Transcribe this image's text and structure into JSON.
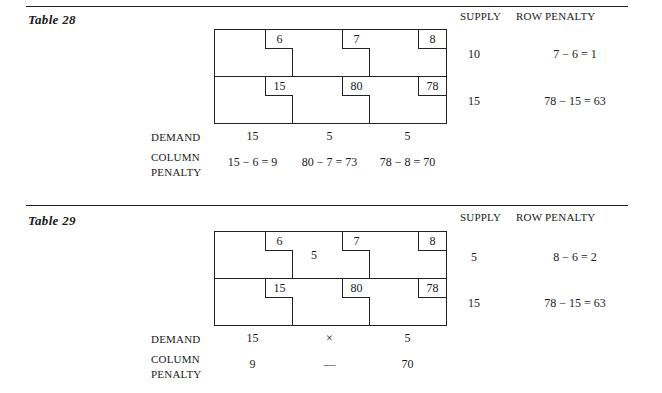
{
  "tables": [
    {
      "title": "Table 28",
      "headers": {
        "supply": "SUPPLY",
        "row_penalty": "ROW PENALTY"
      },
      "costs": [
        [
          "6",
          "7",
          "8"
        ],
        [
          "15",
          "80",
          "78"
        ]
      ],
      "allocations": [
        [
          "",
          "",
          ""
        ],
        [
          "",
          "",
          ""
        ]
      ],
      "supply": [
        "10",
        "15"
      ],
      "row_penalty": [
        "7 − 6 = 1",
        "78 − 15 = 63"
      ],
      "demand_label": "DEMAND",
      "demand": [
        "15",
        "5",
        "5"
      ],
      "column_penalty_label": [
        "COLUMN",
        "PENALTY"
      ],
      "column_penalty": [
        "15 − 6 = 9",
        "80 − 7 = 73",
        "78 − 8 = 70"
      ]
    },
    {
      "title": "Table 29",
      "headers": {
        "supply": "SUPPLY",
        "row_penalty": "ROW PENALTY"
      },
      "costs": [
        [
          "6",
          "7",
          "8"
        ],
        [
          "15",
          "80",
          "78"
        ]
      ],
      "allocations": [
        [
          "",
          "5",
          ""
        ],
        [
          "",
          "",
          ""
        ]
      ],
      "supply": [
        "5",
        "15"
      ],
      "row_penalty": [
        "8 − 6 = 2",
        "78 − 15 = 63"
      ],
      "demand_label": "DEMAND",
      "demand": [
        "15",
        "×",
        "5"
      ],
      "column_penalty_label": [
        "COLUMN",
        "PENALTY"
      ],
      "column_penalty": [
        "9",
        "—",
        "70"
      ]
    }
  ]
}
